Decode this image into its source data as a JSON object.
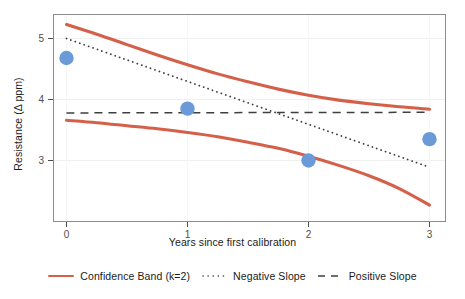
{
  "chart_data": {
    "type": "line",
    "title": "",
    "xlabel": "Years since first calibration",
    "ylabel": "Resistance (Δ ppm)",
    "xlim": [
      -0.14,
      3.14
    ],
    "ylim": [
      2.14,
      5.35
    ],
    "xticks": [
      0,
      1,
      2,
      3
    ],
    "xticklabels": [
      "0",
      "1",
      "2",
      "3"
    ],
    "yticks": [
      3,
      4,
      5
    ],
    "yticklabels": [
      "3",
      "4",
      "5"
    ],
    "grid": true,
    "legend_position": "bottom",
    "series": [
      {
        "name": "Confidence Band (k=2) upper",
        "style": "solid",
        "color": "#D4604A",
        "x": [
          0,
          0.25,
          0.5,
          0.75,
          1,
          1.25,
          1.5,
          1.75,
          2,
          2.25,
          2.5,
          2.75,
          3
        ],
        "y": [
          5.23,
          5.07,
          4.9,
          4.73,
          4.57,
          4.42,
          4.29,
          4.17,
          4.07,
          3.99,
          3.93,
          3.88,
          3.84
        ]
      },
      {
        "name": "Confidence Band (k=2) lower",
        "style": "solid",
        "color": "#D4604A",
        "x": [
          0,
          0.25,
          0.5,
          0.75,
          1,
          1.25,
          1.5,
          1.75,
          2,
          2.25,
          2.5,
          2.75,
          3
        ],
        "y": [
          3.66,
          3.62,
          3.57,
          3.52,
          3.46,
          3.39,
          3.3,
          3.2,
          3.07,
          2.92,
          2.75,
          2.54,
          2.27
        ]
      },
      {
        "name": "Negative Slope",
        "style": "dotted",
        "color": "#3F3F3F",
        "x": [
          0,
          3
        ],
        "y": [
          5.0,
          2.89
        ]
      },
      {
        "name": "Positive Slope",
        "style": "dashed",
        "color": "#3F3F3F",
        "x": [
          0,
          3
        ],
        "y": [
          3.78,
          3.79
        ]
      },
      {
        "name": "Observations",
        "style": "points",
        "color": "#6A9BD8",
        "x": [
          0,
          1,
          2,
          3
        ],
        "y": [
          4.68,
          3.85,
          3.0,
          3.35
        ]
      }
    ]
  },
  "axis": {
    "x_title": "Years since first calibration",
    "y_title": "Resistance (Δ ppm)",
    "x_tick_0": "0",
    "x_tick_1": "1",
    "x_tick_2": "2",
    "x_tick_3": "3",
    "y_tick_3": "3",
    "y_tick_4": "4",
    "y_tick_5": "5"
  },
  "legend": {
    "items": [
      {
        "label": "Confidence Band (k=2)",
        "key": "solid-line-key",
        "color": "#D4604A"
      },
      {
        "label": "Negative Slope",
        "key": "dotted-line-key",
        "color": "#3F3F3F"
      },
      {
        "label": "Positive Slope",
        "key": "dashed-line-key",
        "color": "#3F3F3F"
      }
    ]
  },
  "colors": {
    "band": "#D4604A",
    "reference_line": "#3F3F3F",
    "point": "#6A9BD8",
    "panel_border": "#8C8C8C",
    "grid": "#EFEFEF",
    "text": "#1a1a1a"
  }
}
